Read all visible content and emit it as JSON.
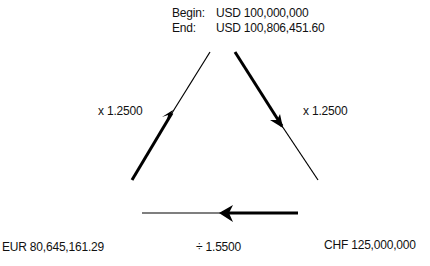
{
  "header": {
    "begin_label": "Begin:",
    "begin_value": "USD 100,000,000",
    "end_label": "End:",
    "end_value": "USD 100,806,451.60"
  },
  "edges": {
    "left_rate": "x 1.2500",
    "right_rate": "x 1.2500",
    "bottom_rate": "÷ 1.5500"
  },
  "nodes": {
    "eur": "EUR 80,645,161.29",
    "chf": "CHF 125,000,000"
  }
}
